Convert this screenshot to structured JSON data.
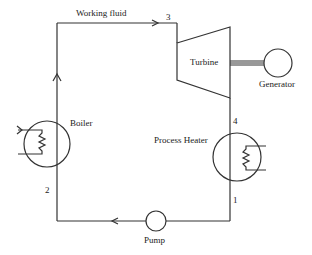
{
  "diagram": {
    "labels": {
      "working_fluid": "Working fluid",
      "turbine": "Turbine",
      "generator": "Generator",
      "boiler": "Boiler",
      "process_heater": "Process Heater",
      "pump": "Pump"
    },
    "state_points": {
      "p1": "1",
      "p2": "2",
      "p3": "3",
      "p4": "4"
    },
    "components": [
      "Boiler",
      "Turbine",
      "Generator",
      "Process Heater",
      "Pump"
    ],
    "flow": [
      "2 -> Boiler -> 3",
      "3 -> Turbine -> 4",
      "4 -> Process Heater -> 1",
      "1 -> Pump -> 2"
    ],
    "colors": {
      "line": "#333333",
      "background": "#ffffff"
    }
  }
}
